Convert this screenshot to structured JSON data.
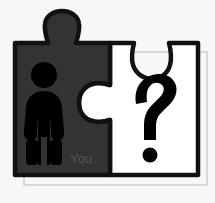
{
  "diagram": {
    "background_color": "#f7f7f5",
    "pieces": [
      {
        "id": "you-piece",
        "label": "You",
        "label_color": "#58585a",
        "fill_color": "#333333",
        "stroke_color": "#111111",
        "icon": "person-icon",
        "icon_color": "#000000",
        "side": "left"
      },
      {
        "id": "unknown-piece",
        "label": "?",
        "label_color": "#000000",
        "fill_color": "#ffffff",
        "stroke_color": "#111111",
        "icon": "question-mark-icon",
        "icon_color": "#000000",
        "side": "right"
      }
    ],
    "outer_frame": {
      "name": "offset-outline-frame",
      "stroke_color": "#c9c9c9"
    }
  }
}
